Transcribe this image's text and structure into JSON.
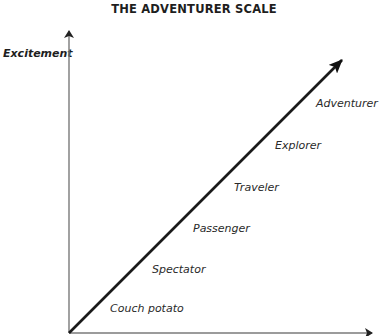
{
  "title": "THE ADVENTURER SCALE",
  "y_axis": {
    "label": "Excitement"
  },
  "x_axis": {
    "label": ""
  },
  "colors": {
    "axis": "#7a7a7a",
    "diagonal": "#1a1a1a",
    "text": "#2a2a2a"
  },
  "stages": [
    {
      "label": "Couch potato"
    },
    {
      "label": "Spectator"
    },
    {
      "label": "Passenger"
    },
    {
      "label": "Traveler"
    },
    {
      "label": "Explorer"
    },
    {
      "label": "Adventurer"
    }
  ]
}
